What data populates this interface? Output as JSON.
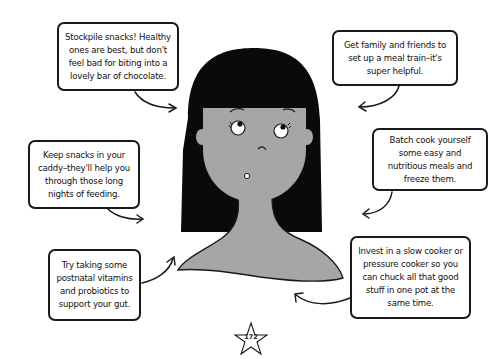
{
  "illustration": {
    "subject": "woman-with-long-black-hair",
    "colors": {
      "hair": "#0a0a0a",
      "skin": "#a6a6a6",
      "outline": "#1a1a1a",
      "background": "#ffffff"
    }
  },
  "tips": [
    {
      "id": "stockpile-snacks",
      "text": "Stockpile snacks! Healthy ones are best, but don't feel bad for biting into a lovely bar of chocolate."
    },
    {
      "id": "meal-train",
      "text": "Get family and friends to set up a meal train–it's super helpful."
    },
    {
      "id": "caddy-snacks",
      "text": "Keep snacks in your caddy–they'll help you through those long nights of feeding."
    },
    {
      "id": "batch-cook",
      "text": "Batch cook yourself some easy and nutritious meals and freeze them."
    },
    {
      "id": "postnatal-vitamins",
      "text": "Try taking some postnatal vitamins and probiotics to support your gut."
    },
    {
      "id": "slow-cooker",
      "text": "Invest in a slow cooker or pressure cooker so you can chuck all that good stuff in one pot at the same time."
    }
  ],
  "page": {
    "number": "172",
    "icon": "star-icon"
  }
}
